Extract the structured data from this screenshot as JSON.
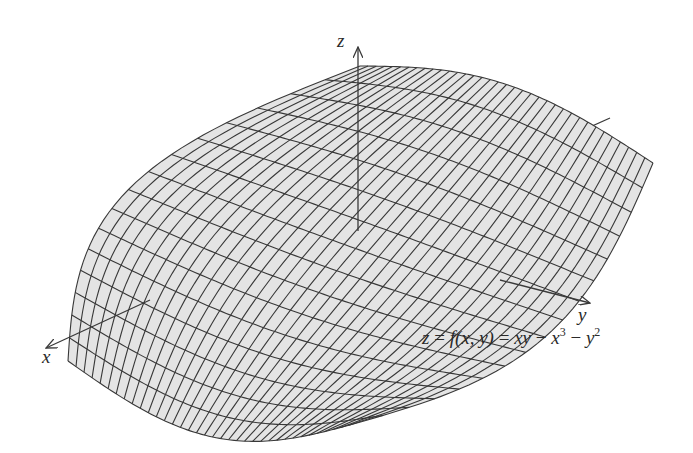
{
  "figure": {
    "type": "3d-surface-plot",
    "equation": {
      "lhs": "z",
      "eq1": " = ",
      "fname": "f",
      "args": "(x, y)",
      "eq2": " = ",
      "term1": "xy",
      "minus1": " − ",
      "term2_base": "x",
      "term2_exp": "3",
      "minus2": " − ",
      "term3_base": "y",
      "term3_exp": "2",
      "full_text": "z = f(x, y) = xy − x^3 − y^2"
    },
    "axes": {
      "x_label": "x",
      "y_label": "y",
      "z_label": "z"
    },
    "colors": {
      "surface_fill": "#e4e4e4",
      "mesh_lines": "#383838",
      "axes": "#3a3a3a",
      "background": "#ffffff"
    },
    "mesh": {
      "u_divisions": 36,
      "v_divisions": 16
    }
  }
}
